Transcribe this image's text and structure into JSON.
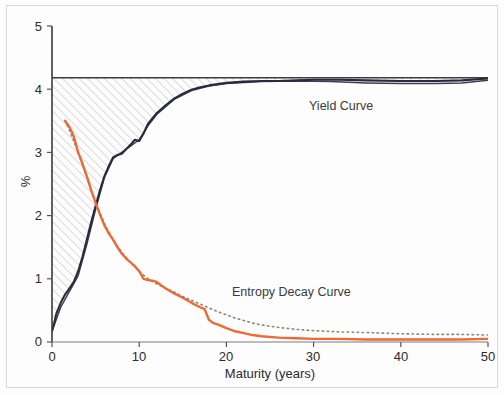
{
  "chart_data": {
    "type": "line",
    "title": "",
    "xlabel": "Maturity (years)",
    "ylabel": "%",
    "xlim": [
      0,
      50
    ],
    "ylim": [
      0,
      5
    ],
    "xticks": [
      0,
      10,
      20,
      30,
      40,
      50
    ],
    "yticks": [
      0,
      1,
      2,
      3,
      4,
      5
    ],
    "grid": false,
    "legend_position": "inline-annotations",
    "annotations": [
      {
        "text": "Yield Curve",
        "x": 30,
        "y": 3.75
      },
      {
        "text": "Entropy Decay Curve",
        "x": 21,
        "y": 0.9
      }
    ],
    "asymptote": {
      "label": "",
      "value": 4.18,
      "color": "#3a3a4a"
    },
    "shaded_region": {
      "description": "diagonally hatched area between yield curve and long-run asymptote",
      "hatch": "diagonal",
      "color": "#b9b9b9"
    },
    "series": [
      {
        "name": "Yield Curve",
        "color": "#2a2a3c",
        "style": "solid",
        "x": [
          0,
          0.25,
          0.5,
          1,
          1.5,
          2,
          2.5,
          3,
          3.5,
          4,
          4.5,
          5,
          5.5,
          6,
          6.5,
          7,
          7.5,
          8,
          8.5,
          9,
          9.5,
          10,
          10.5,
          11,
          12,
          13,
          14,
          15,
          16,
          17,
          18,
          19,
          20,
          22,
          24,
          26,
          28,
          30,
          33,
          36,
          40,
          44,
          47,
          50
        ],
        "y": [
          0.17,
          0.3,
          0.45,
          0.62,
          0.75,
          0.85,
          0.95,
          1.12,
          1.35,
          1.62,
          1.9,
          2.15,
          2.4,
          2.62,
          2.78,
          2.92,
          2.96,
          2.98,
          3.05,
          3.12,
          3.2,
          3.18,
          3.3,
          3.45,
          3.62,
          3.74,
          3.85,
          3.93,
          3.99,
          4.03,
          4.06,
          4.08,
          4.1,
          4.12,
          4.13,
          4.13,
          4.14,
          4.15,
          4.15,
          4.14,
          4.13,
          4.13,
          4.14,
          4.17
        ]
      },
      {
        "name": "Yield Curve (fitted)",
        "color": "#3c3c55",
        "style": "solid-thin",
        "x": [
          0,
          1,
          2,
          3,
          4,
          5,
          6,
          7,
          8,
          9,
          10,
          11,
          12,
          14,
          16,
          18,
          20,
          24,
          28,
          32,
          36,
          40,
          44,
          47,
          50
        ],
        "y": [
          0.17,
          0.55,
          0.8,
          1.05,
          1.55,
          2.1,
          2.6,
          2.9,
          3.0,
          3.1,
          3.2,
          3.42,
          3.6,
          3.84,
          3.98,
          4.05,
          4.09,
          4.12,
          4.13,
          4.12,
          4.1,
          4.09,
          4.09,
          4.1,
          4.14
        ]
      },
      {
        "name": "Entropy Decay Curve",
        "color": "#ec6a35",
        "style": "solid",
        "x": [
          1.5,
          2,
          2.5,
          3,
          3.5,
          4,
          4.5,
          5,
          5.5,
          6,
          6.5,
          7,
          7.5,
          8,
          8.5,
          9,
          9.5,
          10,
          10.5,
          11,
          11.5,
          12,
          12.5,
          13,
          14,
          15,
          16,
          17,
          17.5,
          18,
          18.5,
          19,
          20,
          21,
          22,
          23,
          24,
          26,
          28,
          30,
          33,
          36,
          40,
          44,
          47,
          50
        ],
        "y": [
          3.5,
          3.4,
          3.25,
          3.0,
          2.82,
          2.62,
          2.4,
          2.2,
          2.02,
          1.85,
          1.72,
          1.62,
          1.5,
          1.4,
          1.32,
          1.26,
          1.2,
          1.12,
          1.0,
          0.98,
          0.97,
          0.95,
          0.9,
          0.85,
          0.77,
          0.7,
          0.62,
          0.55,
          0.52,
          0.35,
          0.3,
          0.28,
          0.22,
          0.17,
          0.14,
          0.11,
          0.09,
          0.07,
          0.06,
          0.05,
          0.05,
          0.04,
          0.04,
          0.04,
          0.04,
          0.05
        ]
      },
      {
        "name": "Entropy Decay Curve (fitted)",
        "color": "#8a8a6e",
        "style": "dotted",
        "x": [
          1.5,
          2,
          3,
          4,
          5,
          6,
          7,
          8,
          9,
          10,
          11,
          12,
          13,
          14,
          15,
          16,
          17,
          18,
          19,
          20,
          21,
          22,
          23,
          24,
          26,
          28,
          30,
          33,
          36,
          40,
          44,
          47,
          50
        ],
        "y": [
          3.5,
          3.35,
          3.0,
          2.6,
          2.2,
          1.88,
          1.62,
          1.42,
          1.26,
          1.12,
          1.0,
          0.92,
          0.85,
          0.79,
          0.72,
          0.66,
          0.6,
          0.54,
          0.48,
          0.43,
          0.38,
          0.34,
          0.3,
          0.27,
          0.23,
          0.2,
          0.18,
          0.16,
          0.15,
          0.13,
          0.12,
          0.12,
          0.11
        ]
      }
    ]
  },
  "axes": {
    "y_title": "%",
    "x_title": "Maturity (years)",
    "y_tick_labels": [
      "5",
      "4",
      "3",
      "2",
      "1",
      "0"
    ],
    "x_tick_labels": [
      "0",
      "10",
      "20",
      "30",
      "40",
      "50"
    ]
  },
  "labels": {
    "yield_curve": "Yield Curve",
    "entropy_curve": "Entropy Decay Curve"
  },
  "colors": {
    "yield_line": "#2a2a3c",
    "entropy_line": "#ec6a35",
    "entropy_fit": "#8a8a6e",
    "hatch": "#b9b9b9",
    "axis": "#555555",
    "frame": "#d8d8d8"
  }
}
